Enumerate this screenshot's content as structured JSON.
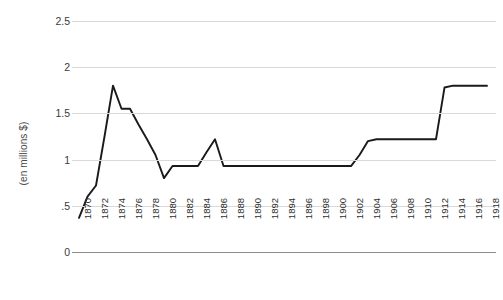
{
  "chart_data": {
    "type": "line",
    "title": "",
    "subtitle": "",
    "xlabel": "",
    "ylabel": "(en millions $)",
    "grid": true,
    "legend": false,
    "xlim": [
      1870,
      1918
    ],
    "ylim": [
      0,
      2.5
    ],
    "ytick_labels": [
      "0",
      ".5",
      "1",
      "1.5",
      "2",
      "2.5"
    ],
    "ytick_values": [
      0,
      0.5,
      1,
      1.5,
      2,
      2.5
    ],
    "xtick_labels": [
      "1870",
      "1872",
      "1874",
      "1876",
      "1878",
      "1880",
      "1882",
      "1884",
      "1886",
      "1888",
      "1890",
      "1892",
      "1894",
      "1896",
      "1898",
      "1900",
      "1902",
      "1904",
      "1906",
      "1908",
      "1910",
      "1912",
      "1914",
      "1916",
      "1918"
    ],
    "xtick_values": [
      1870,
      1872,
      1874,
      1876,
      1878,
      1880,
      1882,
      1884,
      1886,
      1888,
      1890,
      1892,
      1894,
      1896,
      1898,
      1900,
      1902,
      1904,
      1906,
      1908,
      1910,
      1912,
      1914,
      1916,
      1918
    ],
    "series": [
      {
        "name": "valeur",
        "color": "#1a1a1a",
        "x": [
          1870,
          1871,
          1872,
          1873,
          1874,
          1875,
          1876,
          1877,
          1878,
          1879,
          1880,
          1881,
          1882,
          1883,
          1884,
          1885,
          1886,
          1887,
          1888,
          1889,
          1890,
          1891,
          1892,
          1893,
          1894,
          1895,
          1896,
          1897,
          1898,
          1899,
          1900,
          1901,
          1902,
          1903,
          1904,
          1905,
          1906,
          1907,
          1908,
          1909,
          1910,
          1911,
          1912,
          1913,
          1914,
          1915,
          1916,
          1917,
          1918
        ],
        "values": [
          0.37,
          0.6,
          0.72,
          1.25,
          1.8,
          1.55,
          1.55,
          1.38,
          1.22,
          1.05,
          0.8,
          0.93,
          0.93,
          0.93,
          0.93,
          1.08,
          1.22,
          0.93,
          0.93,
          0.93,
          0.93,
          0.93,
          0.93,
          0.93,
          0.93,
          0.93,
          0.93,
          0.93,
          0.93,
          0.93,
          0.93,
          0.93,
          0.93,
          1.05,
          1.2,
          1.22,
          1.22,
          1.22,
          1.22,
          1.22,
          1.22,
          1.22,
          1.22,
          1.78,
          1.8,
          1.8,
          1.8,
          1.8,
          1.8
        ]
      }
    ],
    "annotations": []
  },
  "axis": {
    "y_title": "(en millions $)"
  },
  "colors": {
    "line": "#1a1a1a",
    "grid": "#d9d9d9",
    "axis": "#8c8c8c",
    "tick_text": "#2e2e2e",
    "background": "#ffffff"
  }
}
